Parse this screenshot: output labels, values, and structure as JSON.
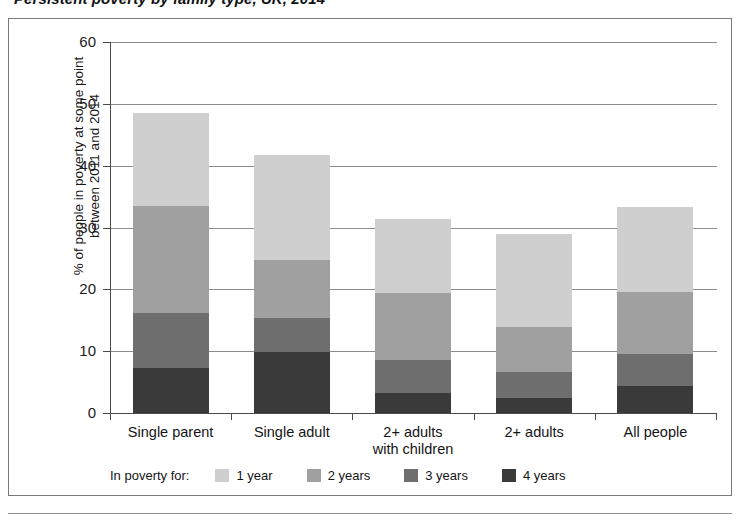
{
  "title": "Persistent poverty by family type, UK, 2014",
  "axis": {
    "y_title_line1": "% of people in poverty at some point",
    "y_title_line2": "between 2011 and 2014",
    "y_ticks": [
      "0",
      "10",
      "20",
      "30",
      "40",
      "50",
      "60"
    ]
  },
  "legend": {
    "title": "In poverty for:",
    "items": [
      {
        "label": "1 year",
        "color": "#cfcfcf"
      },
      {
        "label": "2 years",
        "color": "#a0a0a0"
      },
      {
        "label": "3 years",
        "color": "#6e6e6e"
      },
      {
        "label": "4 years",
        "color": "#3a3a3a"
      }
    ]
  },
  "categories": [
    {
      "line1": "Single parent",
      "line2": ""
    },
    {
      "line1": "Single adult",
      "line2": ""
    },
    {
      "line1": "2+ adults",
      "line2": "with children"
    },
    {
      "line1": "2+ adults",
      "line2": ""
    },
    {
      "line1": "All people",
      "line2": ""
    }
  ],
  "chart_data": {
    "type": "bar",
    "subtype": "stacked",
    "title": "Persistent poverty by family type, UK, 2014",
    "xlabel": "",
    "ylabel": "% of people in poverty at some point between 2011 and 2014",
    "ylim": [
      0,
      60
    ],
    "yticks": [
      0,
      10,
      20,
      30,
      40,
      50,
      60
    ],
    "grid": true,
    "legend_title": "In poverty for:",
    "legend_position": "bottom",
    "categories": [
      "Single parent",
      "Single adult",
      "2+ adults with children",
      "2+ adults",
      "All people"
    ],
    "series": [
      {
        "name": "4 years",
        "color": "#3a3a3a",
        "values": [
          7.3,
          9.9,
          3.2,
          2.4,
          4.4
        ]
      },
      {
        "name": "3 years",
        "color": "#6e6e6e",
        "values": [
          8.9,
          5.5,
          5.4,
          4.2,
          5.1
        ]
      },
      {
        "name": "2 years",
        "color": "#a0a0a0",
        "values": [
          17.3,
          9.4,
          10.8,
          7.3,
          10.1
        ]
      },
      {
        "name": "1 year",
        "color": "#cfcfcf",
        "values": [
          15.0,
          16.9,
          11.9,
          15.1,
          13.7
        ]
      }
    ],
    "totals": [
      48.5,
      41.7,
      31.3,
      29.0,
      33.3
    ]
  }
}
